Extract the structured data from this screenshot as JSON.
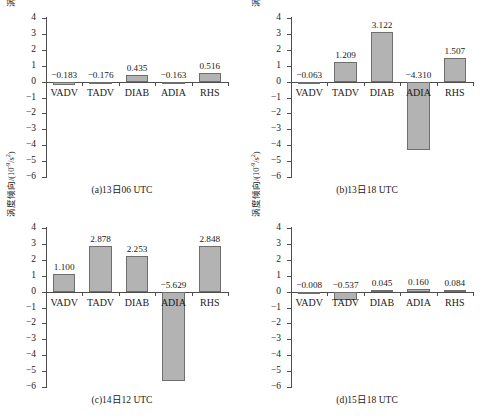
{
  "figure": {
    "y_axis_title_main": "涡度倾向/(10",
    "y_axis_title_sup": "-9",
    "y_axis_title_tail": "/s",
    "y_axis_title_sup2": "2",
    "y_axis_title_close": ")",
    "y_axis_title_full": "涡度倾向/(10-9/s2)",
    "bar_fill_color": "#b3b3b3",
    "bar_border_color": "#6e6e6e",
    "axis_color": "#4d4d4d",
    "background_color": "#ffffff",
    "bottom_cutoff_text": ""
  },
  "chart_data": [
    {
      "type": "bar",
      "panel_id": "a",
      "title": "(a)13日06 UTC",
      "categories": [
        "VADV",
        "TADV",
        "DIAB",
        "ADIA",
        "RHS"
      ],
      "values": [
        -0.183,
        -0.176,
        0.435,
        -0.163,
        0.516
      ],
      "labels": [
        "−0.183",
        "−0.176",
        "0.435",
        "−0.163",
        "0.516"
      ],
      "xlabel": "",
      "ylabel": "涡度倾向/(10-9/s2)",
      "ylim": [
        -6,
        4
      ],
      "yticks": [
        4,
        3,
        2,
        1,
        0,
        -1,
        -2,
        -3,
        -4,
        -5,
        -6
      ],
      "ytick_labels": [
        "4",
        "3",
        "2",
        "1",
        "0",
        "−1",
        "−2",
        "−3",
        "−4",
        "−5",
        "−6"
      ],
      "grid": false,
      "legend": "none"
    },
    {
      "type": "bar",
      "panel_id": "b",
      "title": "(b)13日18 UTC",
      "categories": [
        "VADV",
        "TADV",
        "DIAB",
        "ADIA",
        "RHS"
      ],
      "values": [
        -0.063,
        1.209,
        3.122,
        -4.31,
        1.507
      ],
      "labels": [
        "−0.063",
        "1.209",
        "3.122",
        "−4.310",
        "1.507"
      ],
      "xlabel": "",
      "ylabel": "涡度倾向/(10-9/s2)",
      "ylim": [
        -6,
        4
      ],
      "yticks": [
        4,
        3,
        2,
        1,
        0,
        -1,
        -2,
        -3,
        -4,
        -5,
        -6
      ],
      "ytick_labels": [
        "4",
        "3",
        "2",
        "1",
        "0",
        "−1",
        "−2",
        "−3",
        "−4",
        "−5",
        "−6"
      ],
      "grid": false,
      "legend": "none"
    },
    {
      "type": "bar",
      "panel_id": "c",
      "title": "(c)14日12 UTC",
      "categories": [
        "VADV",
        "TADV",
        "DIAB",
        "ADIA",
        "RHS"
      ],
      "values": [
        1.1,
        2.878,
        2.253,
        -5.629,
        2.848
      ],
      "labels": [
        "1.100",
        "2.878",
        "2.253",
        "−5.629",
        "2.848"
      ],
      "xlabel": "",
      "ylabel": "涡度倾向/(10-9/s2)",
      "ylim": [
        -6,
        4
      ],
      "yticks": [
        4,
        3,
        2,
        1,
        0,
        -1,
        -2,
        -3,
        -4,
        -5,
        -6
      ],
      "ytick_labels": [
        "4",
        "3",
        "2",
        "1",
        "0",
        "−1",
        "−2",
        "−3",
        "−4",
        "−5",
        "−6"
      ],
      "grid": false,
      "legend": "none"
    },
    {
      "type": "bar",
      "panel_id": "d",
      "title": "(d)15日18 UTC",
      "categories": [
        "VADV",
        "TADV",
        "DIAB",
        "ADIA",
        "RHS"
      ],
      "values": [
        -0.008,
        -0.537,
        0.045,
        0.16,
        0.084
      ],
      "labels": [
        "−0.008",
        "−0.537",
        "0.045",
        "0.160",
        "0.084"
      ],
      "xlabel": "",
      "ylabel": "涡度倾向/(10-9/s2)",
      "ylim": [
        -6,
        4
      ],
      "yticks": [
        4,
        3,
        2,
        1,
        0,
        -1,
        -2,
        -3,
        -4,
        -5,
        -6
      ],
      "ytick_labels": [
        "4",
        "3",
        "2",
        "1",
        "0",
        "−1",
        "−2",
        "−3",
        "−4",
        "−5",
        "−6"
      ],
      "grid": false,
      "legend": "none"
    }
  ]
}
